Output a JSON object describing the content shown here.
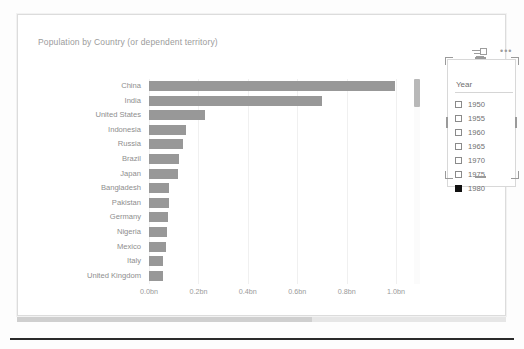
{
  "chart_visual": {
    "title": "Population by Country (or dependent territory)"
  },
  "slicer": {
    "title": "Year",
    "filter_icon": "filter-icon",
    "more_options": "•••",
    "items": [
      {
        "label": "1950",
        "checked": false
      },
      {
        "label": "1955",
        "checked": false
      },
      {
        "label": "1960",
        "checked": false
      },
      {
        "label": "1965",
        "checked": false
      },
      {
        "label": "1970",
        "checked": false
      },
      {
        "label": "1975",
        "checked": false
      },
      {
        "label": "1980",
        "checked": true
      }
    ]
  },
  "chart_data": {
    "type": "bar",
    "orientation": "horizontal",
    "title": "Population by Country (or dependent territory)",
    "xlabel": "",
    "ylabel": "",
    "xlim": [
      0,
      1.04
    ],
    "grid": true,
    "legend": "none",
    "bar_color": "#989898",
    "tick_labels": [
      "0.0bn",
      "0.2bn",
      "0.4bn",
      "0.6bn",
      "0.8bn",
      "1.0bn"
    ],
    "tick_values": [
      0.0,
      0.2,
      0.4,
      0.6,
      0.8,
      1.0
    ],
    "categories": [
      "China",
      "India",
      "United States",
      "Indonesia",
      "Russia",
      "Brazil",
      "Japan",
      "Bangladesh",
      "Pakistan",
      "Germany",
      "Nigeria",
      "Mexico",
      "Italy",
      "United Kingdom"
    ],
    "values": [
      0.997,
      0.699,
      0.228,
      0.15,
      0.139,
      0.121,
      0.117,
      0.081,
      0.08,
      0.078,
      0.074,
      0.068,
      0.056,
      0.056
    ]
  }
}
